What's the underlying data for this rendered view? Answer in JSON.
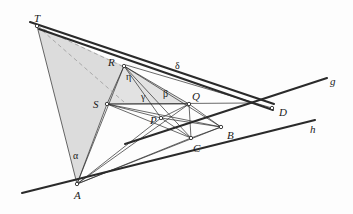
{
  "figure": {
    "background": "#fdfdfd",
    "stroke_color": "#2a2a2a",
    "shade_color": "#dcdcdc",
    "shade_color_light": "#e4e4e4",
    "dash_color": "#9a9a9a"
  },
  "points": {
    "T": {
      "label": "T",
      "x": 37,
      "y": 26,
      "lx": 34,
      "ly": 13
    },
    "R": {
      "label": "R",
      "x": 124,
      "y": 66,
      "lx": 108,
      "ly": 57
    },
    "S": {
      "label": "S",
      "x": 107,
      "y": 104,
      "lx": 93,
      "ly": 99
    },
    "P": {
      "label": "P",
      "x": 161,
      "y": 118,
      "lx": 150,
      "ly": 115
    },
    "Q": {
      "label": "Q",
      "x": 189,
      "y": 104,
      "lx": 192,
      "ly": 91
    },
    "A": {
      "label": "A",
      "x": 77,
      "y": 184,
      "lx": 74,
      "ly": 190
    },
    "B": {
      "label": "B",
      "x": 221,
      "y": 127,
      "lx": 227,
      "ly": 130
    },
    "C": {
      "label": "C",
      "x": 191,
      "y": 138,
      "lx": 193,
      "ly": 143
    },
    "D": {
      "label": "D",
      "x": 272,
      "y": 108,
      "lx": 279,
      "ly": 107
    }
  },
  "line_labels": {
    "g": {
      "label": "g",
      "lx": 330,
      "ly": 76
    },
    "h": {
      "label": "h",
      "lx": 310,
      "ly": 124
    },
    "delta": {
      "label": "δ",
      "lx": 175,
      "ly": 61
    }
  },
  "angle_labels": {
    "alpha": {
      "label": "α",
      "lx": 73,
      "ly": 151
    },
    "eta": {
      "label": "η",
      "lx": 126,
      "ly": 72
    },
    "gamma": {
      "label": "γ",
      "lx": 141,
      "ly": 92
    },
    "beta": {
      "label": "β",
      "lx": 163,
      "ly": 89
    }
  },
  "shaded_regions": [
    {
      "name": "region-T-A-S-R",
      "points": "37,26 77,184 107,104 124,66",
      "fill": "#dcdcdc"
    },
    {
      "name": "region-R-S-Q",
      "points": "124,66 107,104 189,104",
      "fill": "#e2e2e2"
    }
  ],
  "dashed_segments": [
    {
      "name": "dash-T-S",
      "x1": 37,
      "y1": 26,
      "x2": 124,
      "y2": 102
    },
    {
      "name": "dash-T-R",
      "x1": 37,
      "y1": 26,
      "x2": 126,
      "y2": 68
    }
  ],
  "thick_lines": [
    {
      "name": "line-h",
      "x1": 22,
      "y1": 193,
      "x2": 315,
      "y2": 120
    },
    {
      "name": "line-g",
      "x1": 125,
      "y1": 144,
      "x2": 327,
      "y2": 78
    },
    {
      "name": "line-delta-upper",
      "x1": 30,
      "y1": 22,
      "x2": 274,
      "y2": 104
    },
    {
      "name": "line-delta-lower",
      "x1": 39,
      "y1": 29,
      "x2": 273,
      "y2": 110
    }
  ],
  "thin_segments": [
    {
      "name": "seg-T-A",
      "x1": 37,
      "y1": 26,
      "x2": 77,
      "y2": 184
    },
    {
      "name": "seg-A-R",
      "x1": 77,
      "y1": 184,
      "x2": 124,
      "y2": 66
    },
    {
      "name": "seg-A-S",
      "x1": 77,
      "y1": 184,
      "x2": 107,
      "y2": 104
    },
    {
      "name": "seg-A-P",
      "x1": 77,
      "y1": 184,
      "x2": 161,
      "y2": 118
    },
    {
      "name": "seg-A-Q",
      "x1": 77,
      "y1": 184,
      "x2": 189,
      "y2": 104
    },
    {
      "name": "seg-A-C",
      "x1": 77,
      "y1": 184,
      "x2": 191,
      "y2": 138
    },
    {
      "name": "seg-A-B",
      "x1": 77,
      "y1": 184,
      "x2": 221,
      "y2": 127
    },
    {
      "name": "seg-R-S",
      "x1": 124,
      "y1": 66,
      "x2": 107,
      "y2": 104
    },
    {
      "name": "seg-R-P",
      "x1": 124,
      "y1": 66,
      "x2": 161,
      "y2": 118
    },
    {
      "name": "seg-R-Q",
      "x1": 124,
      "y1": 66,
      "x2": 189,
      "y2": 104
    },
    {
      "name": "seg-R-C",
      "x1": 124,
      "y1": 66,
      "x2": 191,
      "y2": 138
    },
    {
      "name": "seg-R-B",
      "x1": 124,
      "y1": 66,
      "x2": 221,
      "y2": 127
    },
    {
      "name": "seg-R-D",
      "x1": 126,
      "y1": 65,
      "x2": 272,
      "y2": 108
    },
    {
      "name": "seg-S-P",
      "x1": 107,
      "y1": 104,
      "x2": 161,
      "y2": 118
    },
    {
      "name": "seg-S-Q",
      "x1": 107,
      "y1": 104,
      "x2": 189,
      "y2": 104
    },
    {
      "name": "seg-S-C",
      "x1": 107,
      "y1": 104,
      "x2": 191,
      "y2": 138
    },
    {
      "name": "seg-S-B",
      "x1": 107,
      "y1": 104,
      "x2": 221,
      "y2": 127
    },
    {
      "name": "seg-P-Q",
      "x1": 161,
      "y1": 118,
      "x2": 189,
      "y2": 104
    },
    {
      "name": "seg-P-C",
      "x1": 161,
      "y1": 118,
      "x2": 191,
      "y2": 138
    },
    {
      "name": "seg-P-B",
      "x1": 161,
      "y1": 118,
      "x2": 221,
      "y2": 127
    },
    {
      "name": "seg-Q-C",
      "x1": 189,
      "y1": 104,
      "x2": 191,
      "y2": 138
    },
    {
      "name": "seg-Q-B",
      "x1": 189,
      "y1": 104,
      "x2": 221,
      "y2": 127
    },
    {
      "name": "seg-C-B",
      "x1": 191,
      "y1": 138,
      "x2": 221,
      "y2": 127
    },
    {
      "name": "seg-S-Dline",
      "x1": 107,
      "y1": 104,
      "x2": 253,
      "y2": 103
    }
  ]
}
